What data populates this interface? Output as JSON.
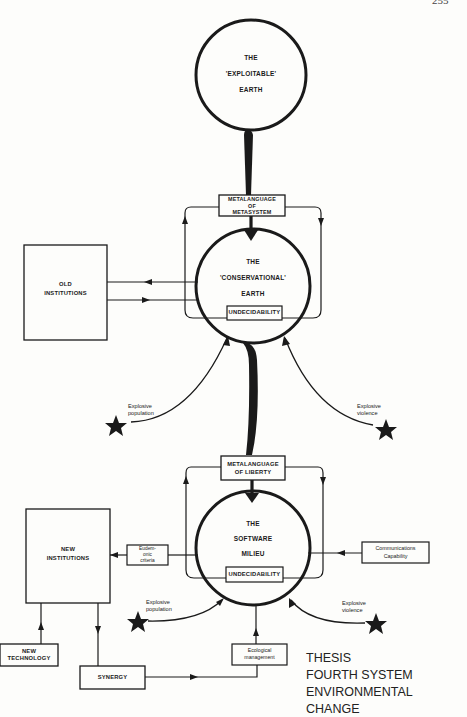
{
  "page_number": "255",
  "nodes": {
    "exploitable_earth": {
      "line1": "THE",
      "line2": "'EXPLOITABLE'",
      "line3": "EARTH"
    },
    "metalanguage_metasystem": {
      "line1": "METALANGUAGE",
      "line2": "OF",
      "line3": "METASYSTEM"
    },
    "conservational_earth": {
      "line1": "THE",
      "line2": "'CONSERVATIONAL'",
      "line3": "EARTH",
      "inner_box": "UNDECIDABILITY"
    },
    "old_institutions": {
      "line1": "OLD",
      "line2": "INSTITUTIONS"
    },
    "explosive_population_1": {
      "line1": "Explosive",
      "line2": "population"
    },
    "explosive_violence_1": {
      "line1": "Explosive",
      "line2": "violence"
    },
    "metalanguage_liberty": {
      "line1": "METALANGUAGE",
      "line2": "OF LIBERTY"
    },
    "software_milieu": {
      "line1": "THE",
      "line2": "SOFTWARE",
      "line3": "MILIEU",
      "inner_box": "UNDECIDABILITY"
    },
    "new_institutions": {
      "line1": "NEW",
      "line2": "INSTITUTIONS"
    },
    "eudemonic_criteria": {
      "line1": "Eudem-",
      "line2": "onic",
      "line3": "criteria"
    },
    "communications_capability": {
      "line1": "Communications",
      "line2": "Capability"
    },
    "explosive_population_2": {
      "line1": "Explosive",
      "line2": "population"
    },
    "explosive_violence_2": {
      "line1": "Explosive",
      "line2": "violence"
    },
    "new_technology": {
      "line1": "NEW",
      "line2": "TECHNOLOGY"
    },
    "synergy": {
      "line1": "SYNERGY"
    },
    "ecological_management": {
      "line1": "Ecological",
      "line2": "management"
    }
  },
  "caption": {
    "line1": "THESIS",
    "line2": "FOURTH SYSTEM",
    "line3": "ENVIRONMENTAL CHANGE"
  },
  "colors": {
    "ink": "#1a1a1a",
    "paper": "#fdfdfb"
  }
}
